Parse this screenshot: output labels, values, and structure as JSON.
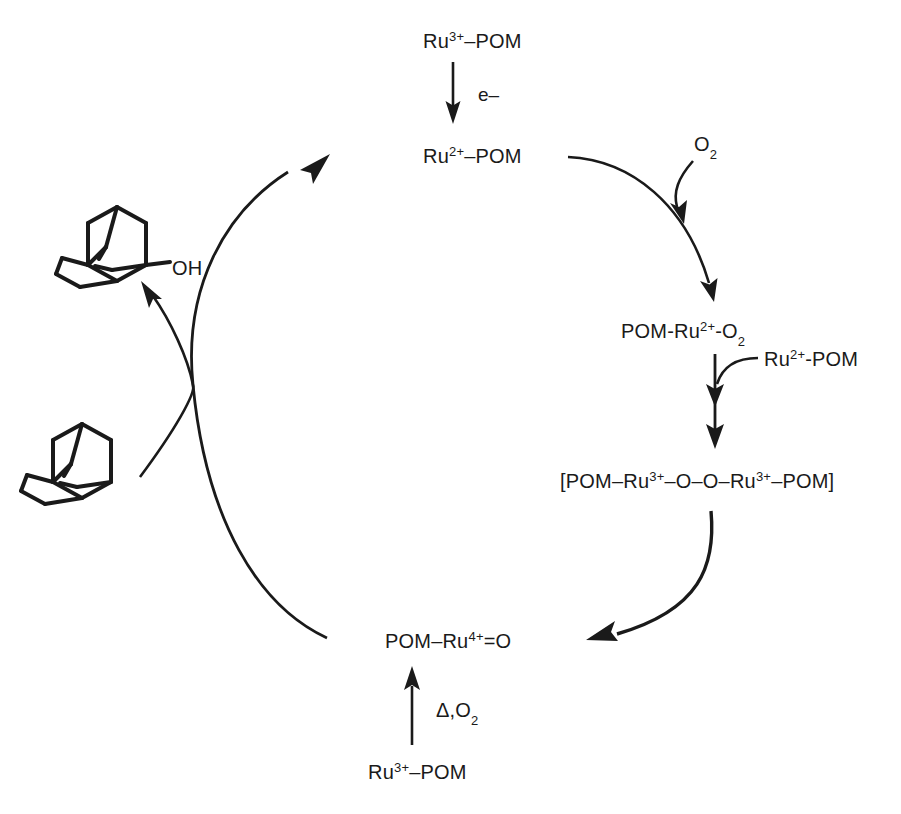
{
  "diagram": {
    "type": "reaction-scheme",
    "background_color": "#ffffff",
    "ink_color": "#1a1a1a",
    "width": 901,
    "height": 814
  },
  "species": {
    "ru3_pom_top": "Ru3+–POM",
    "ru2_pom_top": "Ru2+–POM",
    "pom_ru2_o2": "POM-Ru2+-O2",
    "ru2_pom_side": "Ru2+-POM",
    "peroxo_bracket": "[POM–Ru3+–O–O–Ru3+–POM]",
    "pom_ru4_oxo": "POM–Ru4+=O",
    "ru3_pom_bottom": "Ru3+–POM",
    "dioxygen": "O2"
  },
  "species_parts": {
    "ru3_pom_top": {
      "base1": "Ru",
      "sup1": "3+",
      "tail": "–POM"
    },
    "ru2_pom_top": {
      "base1": "Ru",
      "sup1": "2+",
      "tail": "–POM"
    },
    "pom_ru2_o2": {
      "lead": "POM-Ru",
      "sup1": "2+",
      "mid": "-O",
      "sub1": "2"
    },
    "ru2_pom_side": {
      "base1": "Ru",
      "sup1": "2+",
      "tail": "-POM"
    },
    "peroxo_bracket": {
      "p1": "[POM–Ru",
      "sup1": "3+",
      "p2": "–O–O–Ru",
      "sup2": "3+",
      "p3": "–POM]"
    },
    "pom_ru4_oxo": {
      "lead": "POM–Ru",
      "sup1": "4+",
      "tail": "=O"
    },
    "ru3_pom_bottom": {
      "base1": "Ru",
      "sup1": "3+",
      "tail": "–POM"
    },
    "dioxygen": {
      "base": "O",
      "sub": "2"
    }
  },
  "arrow_labels": {
    "electron": "e–",
    "heat_oxygen_delta": "Δ,O",
    "heat_oxygen_sub": "2",
    "heat_oxygen_full": "Δ,O2"
  },
  "structures": {
    "adamantanol": {
      "name": "1-adamantanol",
      "substituent": "OH"
    },
    "adamantane": {
      "name": "adamantane",
      "substituent": ""
    }
  },
  "steps": [
    {
      "from": "Ru3+–POM",
      "to": "Ru2+–POM",
      "label": "e–",
      "arrow": "straight-down"
    },
    {
      "from": "Ru2+–POM",
      "to": "POM-Ru2+-O2",
      "label": "O2",
      "arrow": "curved-right"
    },
    {
      "from": "POM-Ru2+-O2",
      "to": "[POM–Ru3+–O–O–Ru3+–POM]",
      "label": "Ru2+-POM",
      "arrow": "double-headed-down"
    },
    {
      "from": "[POM–Ru3+–O–O–Ru3+–POM]",
      "to": "POM–Ru4+=O",
      "label": "",
      "arrow": "curved-left"
    },
    {
      "from": "Ru3+–POM",
      "to": "POM–Ru4+=O",
      "label": "Δ,O2",
      "arrow": "straight-up"
    },
    {
      "from": "adamantane",
      "to": "Ru2+–POM",
      "label": "",
      "arrow": "curved-crossing-up"
    },
    {
      "from": "POM–Ru4+=O",
      "to": "1-adamantanol",
      "label": "",
      "arrow": "curved-crossing-left"
    }
  ]
}
